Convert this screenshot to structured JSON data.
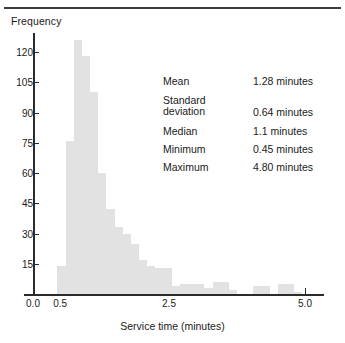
{
  "figure": {
    "y_axis_title": "Frequency",
    "x_axis_title": "Service time (minutes)"
  },
  "stats": {
    "rows": [
      {
        "label": "Mean",
        "value": "1.28 minutes",
        "top": 0
      },
      {
        "label": "Standard\ndeviation",
        "value": "0.64 minutes",
        "top": 19
      },
      {
        "label": "Median",
        "value": "1.1 minutes",
        "top": 50
      },
      {
        "label": "Minimum",
        "value": "0.45 minutes",
        "top": 68
      },
      {
        "label": "Maximum",
        "value": "4.80 minutes",
        "top": 86
      }
    ]
  },
  "chart_data": {
    "type": "bar",
    "title": "",
    "xlabel": "Service time (minutes)",
    "ylabel": "Frequency",
    "xlim": [
      0.0,
      5.3
    ],
    "ylim": [
      0,
      130
    ],
    "grid": false,
    "legend": null,
    "bin_width": 0.15,
    "y_ticks": [
      15,
      30,
      45,
      60,
      75,
      90,
      105,
      120
    ],
    "x_ticks": [
      0.0,
      0.5,
      2.5,
      5.0
    ],
    "x_tick_labels": [
      "0.0",
      "0.5",
      "2.5",
      "5.0"
    ],
    "bin_starts": [
      0.45,
      0.6,
      0.75,
      0.9,
      1.05,
      1.2,
      1.35,
      1.5,
      1.65,
      1.8,
      1.95,
      2.1,
      2.25,
      2.4,
      2.55,
      2.7,
      2.85,
      3.0,
      3.15,
      3.3,
      3.45,
      3.6,
      3.75,
      3.9,
      4.05,
      4.2,
      4.35,
      4.5,
      4.65,
      4.8
    ],
    "values": [
      14,
      76,
      126,
      118,
      100,
      60,
      42,
      33,
      30,
      25,
      17,
      14,
      13,
      13,
      4,
      5,
      5,
      5,
      3,
      6,
      6,
      2,
      0,
      0,
      4,
      4,
      0,
      5,
      5,
      1
    ],
    "peak_value": 126,
    "peak_bin_start": 0.75
  }
}
